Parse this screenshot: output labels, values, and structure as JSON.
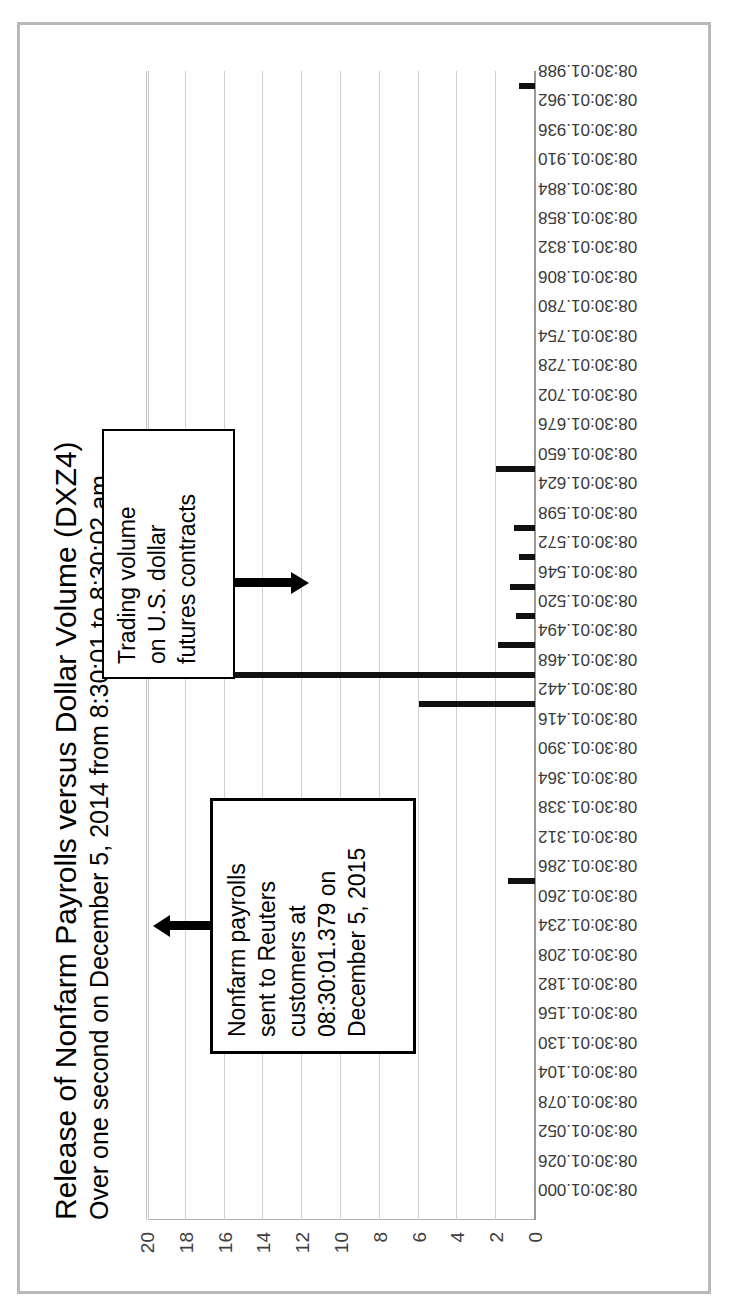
{
  "chart_data": {
    "type": "bar",
    "title": "Release of Nonfarm Payrolls versus Dollar Volume (DXZ4)",
    "subtitle": "Over one second on December 5, 2014 from 8:30:01 to 8:30:02 am",
    "xlabel": "",
    "ylabel": "",
    "ylim": [
      0,
      20
    ],
    "yticks": [
      0,
      2,
      4,
      6,
      8,
      10,
      12,
      14,
      16,
      18,
      20
    ],
    "grid": true,
    "legend": false,
    "orientation": "rotated-90-ccw",
    "categories": [
      "08:30:01.000",
      "08:30:01.026",
      "08:30:01.052",
      "08:30:01.078",
      "08:30:01.104",
      "08:30:01.130",
      "08:30:01.156",
      "08:30:01.182",
      "08:30:01.208",
      "08:30:01.234",
      "08:30:01.260",
      "08:30:01.286",
      "08:30:01.312",
      "08:30:01.338",
      "08:30:01.364",
      "08:30:01.390",
      "08:30:01.416",
      "08:30:01.442",
      "08:30:01.468",
      "08:30:01.494",
      "08:30:01.520",
      "08:30:01.546",
      "08:30:01.572",
      "08:30:01.598",
      "08:30:01.624",
      "08:30:01.650",
      "08:30:01.676",
      "08:30:01.702",
      "08:30:01.728",
      "08:30:01.754",
      "08:30:01.780",
      "08:30:01.806",
      "08:30:01.832",
      "08:30:01.858",
      "08:30:01.884",
      "08:30:01.910",
      "08:30:01.936",
      "08:30:01.962",
      "08:30:01.988"
    ],
    "values": [
      0,
      0,
      0,
      0,
      0,
      0,
      0,
      0,
      0,
      0,
      0,
      1.4,
      0,
      0,
      0,
      0,
      0,
      6.0,
      20.0,
      1.9,
      1.0,
      1.3,
      0.8,
      1.1,
      0,
      2.0,
      0,
      0,
      0,
      0,
      0,
      0,
      0,
      0,
      0,
      0,
      0,
      0,
      0.8
    ],
    "annotations": [
      {
        "id": "payrolls",
        "lines": [
          "Nonfarm payrolls",
          "sent to Reuters",
          "customers at",
          "08:30:01.379 on",
          "December 5, 2015"
        ],
        "arrow": "points-to-baseline"
      },
      {
        "id": "volume",
        "lines": [
          "Trading volume",
          "on U.S. dollar",
          "futures contracts"
        ],
        "arrow": "points-to-bars"
      }
    ]
  },
  "colors": {
    "bar": "#111111",
    "grid": "#cfcfcf",
    "axis_text": "#3a3a3a",
    "frame": "#b9b9b9",
    "background": "#ffffff",
    "annotation_border": "#000000"
  }
}
